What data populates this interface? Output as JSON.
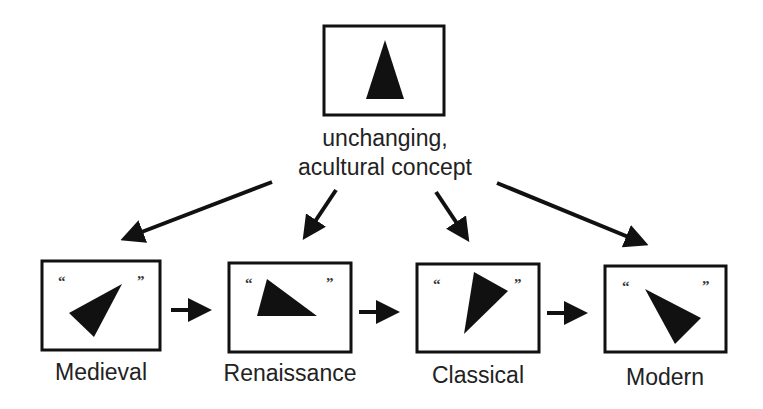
{
  "diagram": {
    "top": {
      "label_line1": "unchanging,",
      "label_line2": "acultural concept",
      "icon": "triangle-upright-icon"
    },
    "periods": [
      {
        "label": "Medieval",
        "open_quote": "“",
        "close_quote": "”"
      },
      {
        "label": "Renaissance",
        "open_quote": "“",
        "close_quote": "”"
      },
      {
        "label": "Classical",
        "open_quote": "“",
        "close_quote": "”"
      },
      {
        "label": "Modern",
        "open_quote": "“",
        "close_quote": "”"
      }
    ],
    "colors": {
      "ink": "#111111",
      "background": "#ffffff"
    }
  }
}
